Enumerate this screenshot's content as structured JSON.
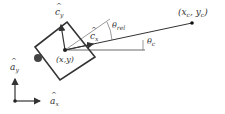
{
  "diagram": {
    "labels": {
      "c_y": {
        "base": "c",
        "sub": "y"
      },
      "c_x": {
        "base": "c",
        "sub": "x"
      },
      "theta_rel": {
        "base": "θ",
        "sub": "rel"
      },
      "theta_c": {
        "base": "θ",
        "sub": "c"
      },
      "target_point": "(x_c, y_c)",
      "target_point_parts": {
        "open": "(",
        "x": "x",
        "xsub": "c",
        "comma": ", ",
        "y": "y",
        "ysub": "c",
        "close": ")"
      },
      "center": "(x,y)",
      "a_y": {
        "base": "a",
        "sub": "y"
      },
      "a_x": {
        "base": "a",
        "sub": "x"
      }
    },
    "colors": {
      "stroke": "#333333",
      "thin_stroke": "#555555",
      "gray_circle": "#444444",
      "background": "#ffffff"
    }
  }
}
